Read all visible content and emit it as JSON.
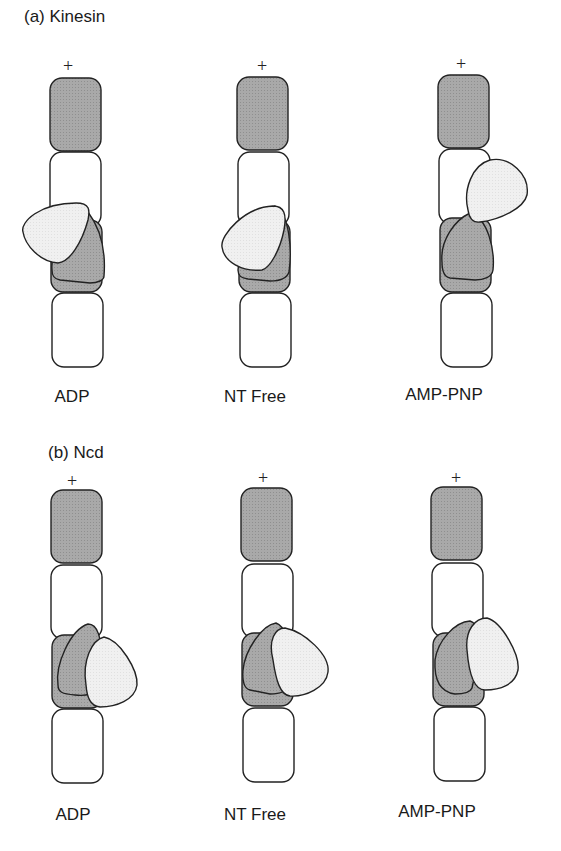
{
  "panels": [
    {
      "id": "a",
      "title": "(a) Kinesin",
      "states": [
        {
          "label": "ADP",
          "plus": "+"
        },
        {
          "label": "NT Free",
          "plus": "+"
        },
        {
          "label": "AMP-PNP",
          "plus": "+"
        }
      ]
    },
    {
      "id": "b",
      "title": "(b) Ncd",
      "states": [
        {
          "label": "ADP",
          "plus": "+"
        },
        {
          "label": "NT Free",
          "plus": "+"
        },
        {
          "label": "AMP-PNP",
          "plus": "+"
        }
      ]
    }
  ],
  "colors": {
    "beta_tubulin": "#a9a9a9",
    "alpha_tubulin": "#ffffff",
    "neck_head": "#a6a6a6",
    "free_head": "#efefef",
    "stroke": "#222222"
  }
}
